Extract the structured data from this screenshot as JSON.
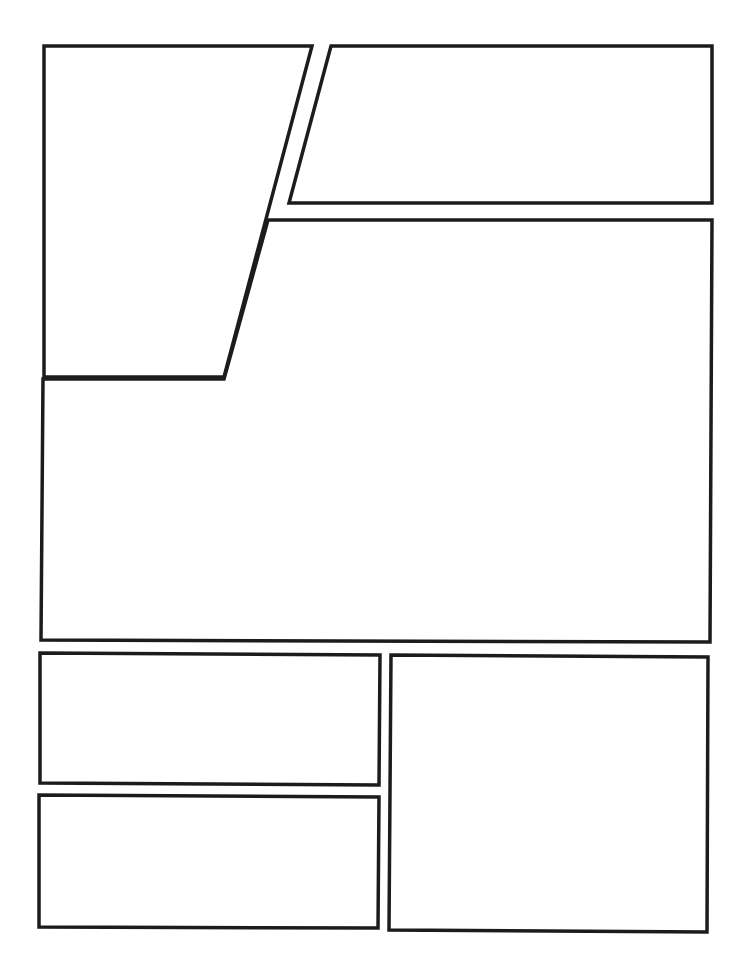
{
  "page": {
    "type": "comic-panel-template",
    "width": 745,
    "height": 972,
    "background": "#ffffff",
    "stroke_color": "#1c1c1c",
    "stroke_width": 3.5
  },
  "panels": [
    {
      "id": "panel-1",
      "shape": "trapezoid",
      "points": "44,46 312,46 224,377 44,377"
    },
    {
      "id": "panel-2",
      "shape": "parallelogram",
      "points": "331,46 712,46 712,203 289,203"
    },
    {
      "id": "panel-3",
      "shape": "l-shape",
      "points": "268,220 712,220 710,642 41,640 43,379 224,379"
    },
    {
      "id": "panel-4",
      "shape": "rectangle",
      "points": "40,653 380,655 379,785 40,783"
    },
    {
      "id": "panel-5",
      "shape": "rectangle",
      "points": "39,795 379,797 378,928 39,927"
    },
    {
      "id": "panel-6",
      "shape": "rectangle",
      "points": "391,655 708,657 707,932 389,930"
    }
  ]
}
